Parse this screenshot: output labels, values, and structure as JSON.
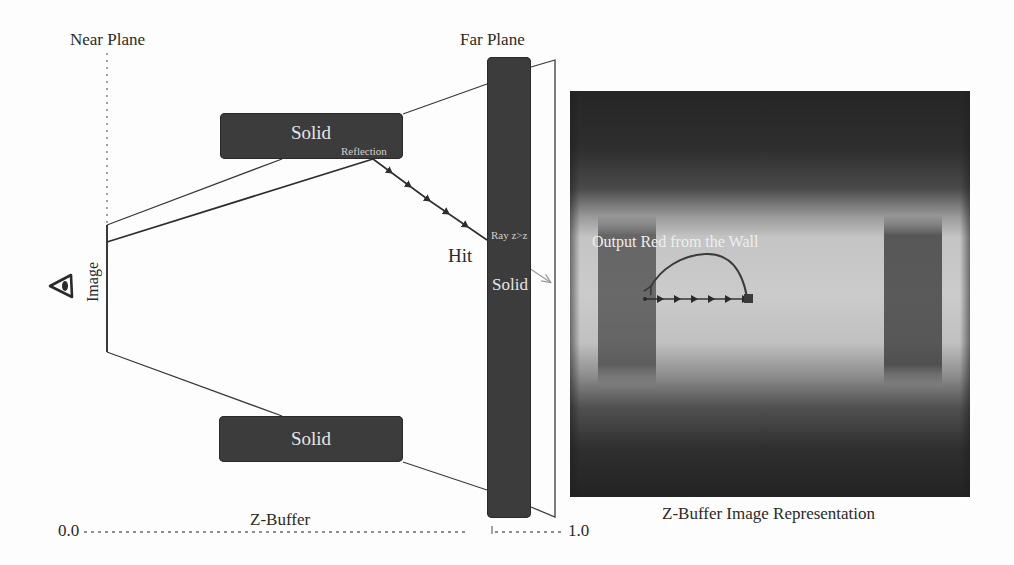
{
  "diagram": {
    "type": "z-buffer screen-space reflection ray march",
    "labels": {
      "near_plane": "Near Plane",
      "far_plane": "Far Plane",
      "image_plane": "Image",
      "hit": "Hit",
      "ray_test": "Ray z>z",
      "reflection": "Reflection",
      "zbuffer_axis": "Z-Buffer",
      "axis_min": "0.0",
      "axis_max": "1.0",
      "zbuffer_image_caption": "Z-Buffer Image Representation",
      "output_annotation": "Output Red from the Wall"
    },
    "solids": [
      {
        "id": "top-solid",
        "label": "Solid",
        "x": 220,
        "y": 113,
        "w": 183,
        "h": 46
      },
      {
        "id": "bottom-solid",
        "label": "Solid",
        "x": 219,
        "y": 416,
        "w": 184,
        "h": 46
      },
      {
        "id": "far-solid",
        "label": "Solid",
        "x": 487,
        "y": 57,
        "w": 44,
        "h": 461
      }
    ],
    "icons": {
      "camera": "eye-icon"
    },
    "colors": {
      "box_fill": "#3c3c3c",
      "box_text": "#e6e6e6",
      "line": "#3a3a3a",
      "ray_exit": "#9a9a9a",
      "label_text": "#2a2a2a",
      "arc": "#3a3a3a"
    },
    "ray_march": {
      "steps_to_hit": 5,
      "steps_in_image": 6
    }
  }
}
